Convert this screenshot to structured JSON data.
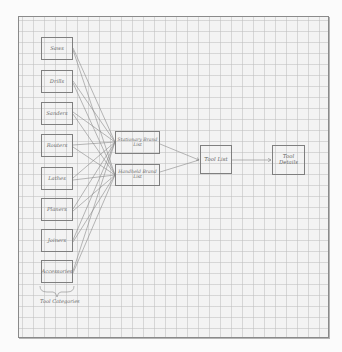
{
  "diagram": {
    "type": "hand-drawn flow diagram on graph paper",
    "categories": [
      {
        "label": "Saws",
        "y": 37
      },
      {
        "label": "Drills",
        "y": 70
      },
      {
        "label": "Sanders",
        "y": 102
      },
      {
        "label": "Routers",
        "y": 134
      },
      {
        "label": "Lathes",
        "y": 167
      },
      {
        "label": "Planers",
        "y": 198
      },
      {
        "label": "Joiners",
        "y": 229
      },
      {
        "label": "Accessories",
        "y": 260
      }
    ],
    "categories_caption": "Tool Categories",
    "brand_lists": [
      {
        "label": "Stationary Brand List"
      },
      {
        "label": "Handheld Brand List"
      }
    ],
    "tool_list": {
      "label": "Tool List"
    },
    "tool_details": {
      "label": "Tool Details"
    },
    "edges": [
      "each category -> Stationary Brand List",
      "each category -> Handheld Brand List",
      "Stationary Brand List -> Tool List",
      "Handheld Brand List -> Tool List",
      "Tool List -> Tool Details"
    ],
    "colors": {
      "ink": "#6a6a6a",
      "grid": "#bebebe",
      "paper": "#f3f3f3"
    }
  }
}
